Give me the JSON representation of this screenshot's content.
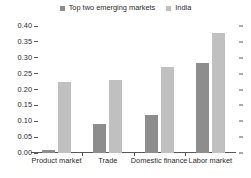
{
  "chart_data": {
    "type": "bar",
    "title": "",
    "xlabel": "",
    "ylabel": "",
    "categories": [
      "Product market",
      "Trade",
      "Domestic finance",
      "Labor market"
    ],
    "series": [
      {
        "name": "Top two emerging markets",
        "color": "#8d8d8d",
        "values": [
          0.01,
          0.09,
          0.12,
          0.285
        ]
      },
      {
        "name": "India",
        "color": "#c0c0c0",
        "values": [
          0.225,
          0.23,
          0.27,
          0.378
        ]
      }
    ],
    "ylim": [
      0.0,
      0.4
    ],
    "ytick_step": 0.05,
    "ytick_labels": [
      "0.00",
      "0.05",
      "0.10",
      "0.15",
      "0.20",
      "0.25",
      "0.30",
      "0.35",
      "0.40"
    ],
    "ytick_values": [
      0.0,
      0.05,
      0.1,
      0.15,
      0.2,
      0.25,
      0.3,
      0.35,
      0.4
    ],
    "grid": false,
    "legend_position": "top-center",
    "right_axis_ticks": true
  },
  "legend": {
    "items": [
      {
        "label": "Top two emerging markets",
        "swatch_color": "#8d8d8d"
      },
      {
        "label": "India",
        "swatch_color": "#c0c0c0"
      }
    ]
  },
  "axis": {
    "line_color": "#585858",
    "text_color": "#2b2b2b"
  }
}
